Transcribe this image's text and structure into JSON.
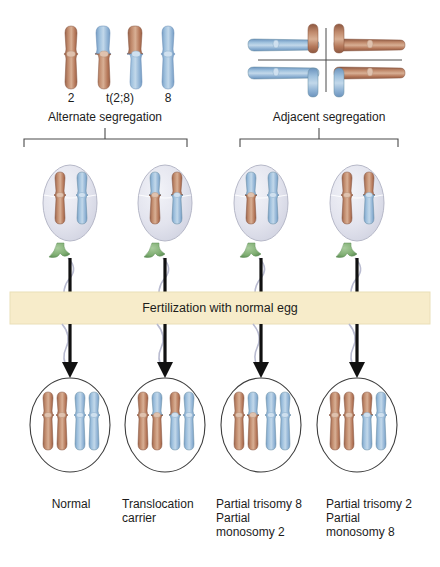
{
  "figure": {
    "title_present": false,
    "background": "#ffffff",
    "type": "biology-diagram"
  },
  "colors": {
    "chrom_brown": "#b5785a",
    "chrom_brown_dark": "#8d5740",
    "chrom_brown_light": "#d3a287",
    "chrom_blue": "#8fb2d4",
    "chrom_blue_dark": "#6b93bd",
    "chrom_blue_light": "#b9d0e6",
    "centromere_brown": "#e0c2ae",
    "centromere_blue": "#cfe0ef",
    "sperm_head": "#e3e4ee",
    "sperm_head_edge": "#b6b8c8",
    "midpiece_green": "#7fae72",
    "tail": "#b9bbd0",
    "banner_fill": "#f7ecca",
    "banner_edge": "#eadfb8",
    "arrow": "#111111",
    "line": "#4a4a4a",
    "zygote_edge": "#3d3d3d"
  },
  "top_left_panel": {
    "name": "alternate-segregation-panel",
    "chromosome_numbers": [
      "2",
      "t(2;8)",
      "8"
    ],
    "caption": "Alternate segregation",
    "chromosomes": [
      {
        "id": "chr2",
        "top": "brown",
        "bottom": "brown",
        "label": "2"
      },
      {
        "id": "der2",
        "top": "blue",
        "bottom": "brown",
        "label": "t(2;8)"
      },
      {
        "id": "der8",
        "top": "brown",
        "bottom": "blue",
        "label": ""
      },
      {
        "id": "chr8",
        "top": "blue",
        "bottom": "blue",
        "label": "8"
      }
    ]
  },
  "top_right_panel": {
    "name": "adjacent-segregation-panel",
    "caption": "Adjacent segregation",
    "quadrants": [
      {
        "position": "top-left",
        "color": "blue",
        "tip": "brown"
      },
      {
        "position": "top-right",
        "color": "brown",
        "tip": "brown"
      },
      {
        "position": "bottom-left",
        "color": "blue",
        "tip": "blue"
      },
      {
        "position": "bottom-right",
        "color": "brown",
        "tip": "blue"
      }
    ]
  },
  "gametes": {
    "name": "sperm-row",
    "count": 4,
    "cells": [
      {
        "index": 1,
        "chromosomes": [
          {
            "top": "brown",
            "bottom": "brown"
          },
          {
            "top": "blue",
            "bottom": "blue"
          }
        ]
      },
      {
        "index": 2,
        "chromosomes": [
          {
            "top": "blue",
            "bottom": "brown"
          },
          {
            "top": "brown",
            "bottom": "blue"
          }
        ]
      },
      {
        "index": 3,
        "chromosomes": [
          {
            "top": "blue",
            "bottom": "brown"
          },
          {
            "top": "blue",
            "bottom": "blue"
          }
        ]
      },
      {
        "index": 4,
        "chromosomes": [
          {
            "top": "brown",
            "bottom": "brown"
          },
          {
            "top": "brown",
            "bottom": "blue"
          }
        ]
      }
    ]
  },
  "banner": {
    "name": "fertilization-banner",
    "text": "Fertilization with normal egg"
  },
  "zygotes": {
    "name": "zygote-row",
    "count": 4,
    "cells": [
      {
        "index": 1,
        "chromosomes": [
          {
            "top": "brown",
            "bottom": "brown"
          },
          {
            "top": "brown",
            "bottom": "brown"
          },
          {
            "top": "blue",
            "bottom": "blue"
          },
          {
            "top": "blue",
            "bottom": "blue"
          }
        ]
      },
      {
        "index": 2,
        "chromosomes": [
          {
            "top": "brown",
            "bottom": "brown"
          },
          {
            "top": "blue",
            "bottom": "brown"
          },
          {
            "top": "brown",
            "bottom": "blue"
          },
          {
            "top": "blue",
            "bottom": "blue"
          }
        ]
      },
      {
        "index": 3,
        "chromosomes": [
          {
            "top": "brown",
            "bottom": "brown"
          },
          {
            "top": "blue",
            "bottom": "brown"
          },
          {
            "top": "blue",
            "bottom": "blue"
          },
          {
            "top": "blue",
            "bottom": "blue"
          }
        ]
      },
      {
        "index": 4,
        "chromosomes": [
          {
            "top": "brown",
            "bottom": "brown"
          },
          {
            "top": "brown",
            "bottom": "brown"
          },
          {
            "top": "brown",
            "bottom": "blue"
          },
          {
            "top": "blue",
            "bottom": "blue"
          }
        ]
      }
    ]
  },
  "outcome_labels": [
    {
      "name": "outcome-normal",
      "text": "Normal"
    },
    {
      "name": "outcome-translocation-carrier",
      "text": "Translocation\ncarrier"
    },
    {
      "name": "outcome-partial-trisomy-8",
      "text": "Partial trisomy 8\nPartial\nmonosomy 2"
    },
    {
      "name": "outcome-partial-trisomy-2",
      "text": "Partial trisomy 2\nPartial\nmonosomy 8"
    }
  ]
}
